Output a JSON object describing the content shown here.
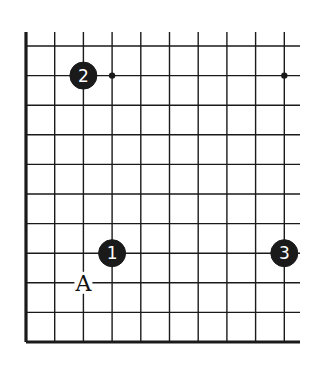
{
  "diagram": {
    "type": "go-board-fragment",
    "board": {
      "columns": 10,
      "rows": 11,
      "edges": [
        "left",
        "bottom"
      ],
      "line_color": "#1a1a1a"
    },
    "star_points": [
      {
        "col": 3,
        "row": 1
      },
      {
        "col": 9,
        "row": 1
      }
    ],
    "stones": [
      {
        "number": "1",
        "color": "black",
        "col": 3,
        "row": 7
      },
      {
        "number": "2",
        "color": "black",
        "col": 2,
        "row": 1
      },
      {
        "number": "3",
        "color": "black",
        "col": 9,
        "row": 7
      }
    ],
    "labels": [
      {
        "text": "A",
        "col": 2,
        "row": 8
      }
    ]
  }
}
